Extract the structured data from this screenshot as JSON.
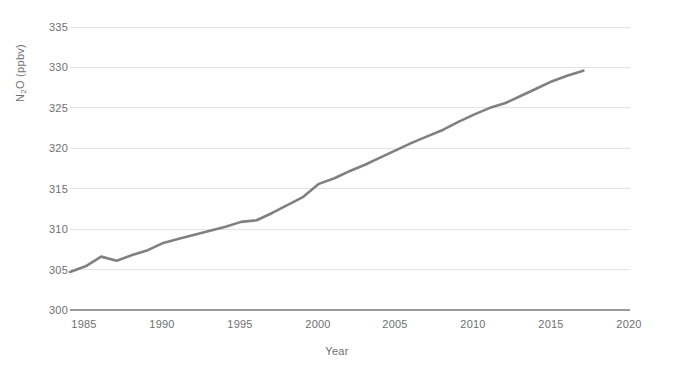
{
  "chart_data": {
    "type": "line",
    "title": "",
    "xlabel": "Year",
    "ylabel": "N2O (ppbv)",
    "ylabel_html": "N<sub>2</sub>O (ppbv)",
    "xlim": [
      1984,
      2020
    ],
    "ylim": [
      300,
      335
    ],
    "xticks": [
      1985,
      1990,
      1995,
      2000,
      2005,
      2010,
      2015,
      2020
    ],
    "yticks": [
      300,
      305,
      310,
      315,
      320,
      325,
      330,
      335
    ],
    "grid": true,
    "grid_axis": "y",
    "legend": "none",
    "line_color": "#808080",
    "grid_color": "#e3e3e3",
    "axis_color": "#9a9a9a",
    "text_color": "#6f6f6f",
    "series": [
      {
        "name": "N2O (ppbv)",
        "x": [
          1984,
          1985,
          1986,
          1987,
          1988,
          1989,
          1990,
          1991,
          1992,
          1993,
          1994,
          1995,
          1996,
          1997,
          1998,
          1999,
          2000,
          2001,
          2002,
          2003,
          2004,
          2005,
          2006,
          2007,
          2008,
          2009,
          2010,
          2011,
          2012,
          2013,
          2014,
          2015,
          2016,
          2017
        ],
        "values": [
          304.7,
          305.4,
          306.6,
          306.1,
          306.8,
          307.4,
          308.3,
          308.8,
          309.3,
          309.8,
          310.3,
          310.9,
          311.1,
          312.0,
          313.0,
          314.0,
          315.6,
          316.3,
          317.2,
          318.0,
          318.9,
          319.8,
          320.7,
          321.5,
          322.3,
          323.3,
          324.2,
          325.0,
          325.6,
          326.5,
          327.4,
          328.3,
          329.0,
          329.6
        ]
      }
    ]
  },
  "axes": {
    "y_title": "N",
    "y_title_sub": "2",
    "y_title_rest": "O (ppbv)",
    "x_title": "Year"
  }
}
